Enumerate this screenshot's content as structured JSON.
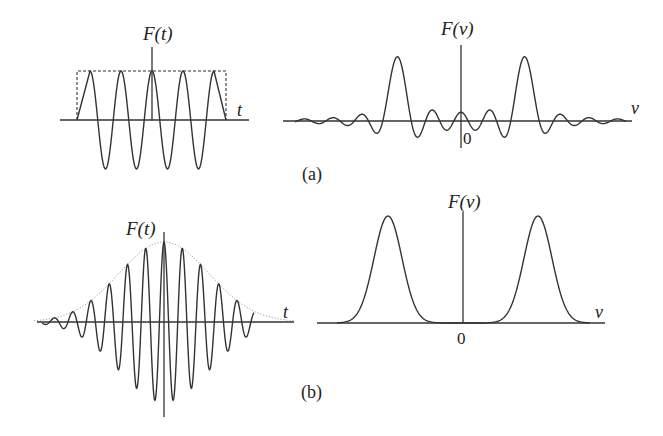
{
  "figure": {
    "panel_a": {
      "caption": "(a)",
      "time": {
        "ylabel": "F(t)",
        "xlabel": "t",
        "description": "Truncated cosine (5 cycles) inside a dashed rectangular window"
      },
      "spectrum": {
        "ylabel": "F(ν)",
        "xlabel": "ν",
        "origin_label": "0",
        "description": "Two sinc-shaped peaks symmetric about 0 with decaying sidelobes"
      }
    },
    "panel_b": {
      "caption": "(b)",
      "time": {
        "ylabel": "F(t)",
        "xlabel": "t",
        "description": "Gaussian-enveloped cosine wave packet with dotted envelope"
      },
      "spectrum": {
        "ylabel": "F(ν)",
        "xlabel": "ν",
        "origin_label": "0",
        "description": "Two Gaussian peaks symmetric about 0, no sidelobes"
      }
    }
  },
  "geometry": {
    "a_time": {
      "x0": 60,
      "x1": 249,
      "axis_y": 120,
      "cx": 152,
      "amp": 49,
      "period": 31,
      "win_left": 77,
      "win_right": 226,
      "vtop": 47
    },
    "a_spec": {
      "x0": 283,
      "x1": 632,
      "axis_y": 121,
      "cx": 461,
      "peak_offset": 64,
      "amp": 63,
      "lobe_width": 14.5,
      "vtop": 45,
      "vbot": 148
    },
    "b_time": {
      "x0": 37,
      "x1": 294,
      "axis_y": 322,
      "cx": 164,
      "amp": 80,
      "period": 18.3,
      "sigma": 45,
      "vtop": 232,
      "vbot": 417
    },
    "b_spec": {
      "x0": 317,
      "x1": 605,
      "axis_y": 323,
      "cx": 463,
      "peak_offset": 75,
      "amp": 107,
      "sigma": 14,
      "vtop": 212
    }
  }
}
